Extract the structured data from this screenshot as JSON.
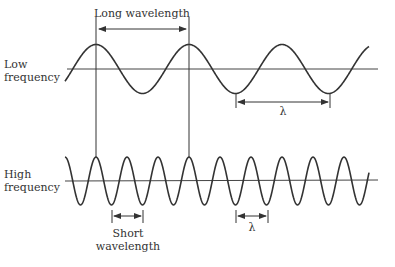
{
  "labels": {
    "long_wavelength": "Long wavelength",
    "low_frequency_line1": "Low",
    "low_frequency_line2": "frequency",
    "high_frequency_line1": "High",
    "high_frequency_line2": "frequency",
    "short_wavelength_line1": "Short",
    "short_wavelength_line2": "wavelength",
    "lambda_low": "λ",
    "lambda_high": "λ"
  },
  "colors": {
    "line": "#333333",
    "background": "#ffffff"
  },
  "waves": {
    "low": {
      "axis_y": 69,
      "amplitude": 24.5,
      "period_px": 93,
      "first_peak_x": 96,
      "x_start": 65,
      "x_end": 369
    },
    "high": {
      "axis_y": 181,
      "amplitude": 24,
      "period_px": 31,
      "first_peak_x": 96,
      "x_start": 65,
      "x_end": 369
    }
  }
}
